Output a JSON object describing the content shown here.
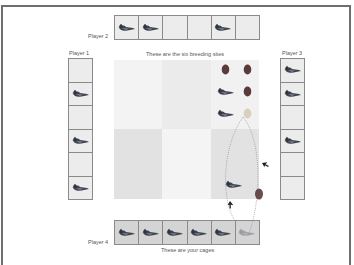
{
  "game": {
    "breeding_sites_caption": "These are the six breeding sites",
    "cages_caption": "These are your cages",
    "colors": {
      "egg": "#5a3a3a",
      "bird_dark": "#3e4450",
      "cell_bg": "#ececec",
      "player4_cell_bg": "#d4d4d4"
    }
  },
  "players": [
    {
      "name": "Player 1",
      "cages": [
        false,
        true,
        false,
        true,
        false,
        true
      ]
    },
    {
      "name": "Player 2",
      "cages": [
        true,
        true,
        false,
        false,
        true,
        false
      ]
    },
    {
      "name": "Player 3",
      "cages": [
        true,
        true,
        false,
        true,
        false,
        false
      ]
    },
    {
      "name": "Player 4",
      "cages": [
        true,
        true,
        true,
        true,
        true,
        "faded"
      ]
    }
  ],
  "breeding_sites": [
    {
      "id": 1,
      "shade": "#f3f3f3",
      "contents": []
    },
    {
      "id": 2,
      "shade": "#ebebeb",
      "contents": []
    },
    {
      "id": 3,
      "shade": "#f1f1f1",
      "contents": [
        "egg",
        "egg",
        "bird",
        "egg",
        "bird",
        "faded-egg"
      ]
    },
    {
      "id": 4,
      "shade": "#e2e2e2",
      "contents": []
    },
    {
      "id": 5,
      "shade": "#f4f4f4",
      "contents": []
    },
    {
      "id": 6,
      "shade": "#e2e2e2",
      "contents": [
        "bird",
        "egg"
      ]
    }
  ],
  "animation": {
    "description": "bird carries egg from breeding site 3 along dotted path to Player 4 cage 6",
    "markers": [
      "cursor-arrow",
      "cursor-arrow"
    ]
  }
}
